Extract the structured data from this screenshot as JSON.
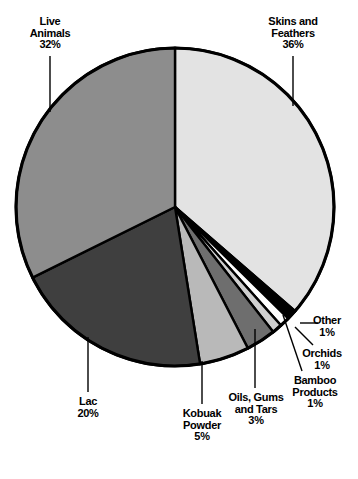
{
  "chart_data": {
    "type": "pie",
    "title": "",
    "subtitle": "",
    "xlabel": "",
    "ylabel": "",
    "legend_position": "none",
    "grid": false,
    "labels_show_percent": true,
    "start_angle_deg": 0,
    "direction": "clockwise",
    "categories": [
      "Skins and Feathers",
      "Other",
      "Orchids",
      "Bamboo Products",
      "Oils, Gums and Tars",
      "Kobuak Powder",
      "Lac",
      "Live Animals"
    ],
    "values": [
      36,
      1,
      1,
      1,
      3,
      5,
      20,
      32
    ],
    "value_labels": [
      "36%",
      "1%",
      "1%",
      "1%",
      "3%",
      "5%",
      "20%",
      "32%"
    ],
    "colors": [
      "#e3e3e3",
      "#000000",
      "#ffffff",
      "#cfcfcf",
      "#6e6e6e",
      "#b9b9b9",
      "#3f3f3f",
      "#8d8d8d"
    ],
    "slice_stroke": "#000000",
    "slices": [
      {
        "name": "Skins and Feathers",
        "value": 36,
        "value_label": "36%",
        "label_line1": "Skins and",
        "label_line2": "Feathers",
        "color": "#e3e3e3"
      },
      {
        "name": "Other",
        "value": 1,
        "value_label": "1%",
        "label_line1": "Other",
        "label_line2": "",
        "color": "#000000"
      },
      {
        "name": "Orchids",
        "value": 1,
        "value_label": "1%",
        "label_line1": "Orchids",
        "label_line2": "",
        "color": "#ffffff"
      },
      {
        "name": "Bamboo Products",
        "value": 1,
        "value_label": "1%",
        "label_line1": "Bamboo",
        "label_line2": "Products",
        "color": "#cfcfcf"
      },
      {
        "name": "Oils, Gums and Tars",
        "value": 3,
        "value_label": "3%",
        "label_line1": "Oils, Gums",
        "label_line2": "and Tars",
        "color": "#6e6e6e"
      },
      {
        "name": "Kobuak Powder",
        "value": 5,
        "value_label": "5%",
        "label_line1": "Kobuak",
        "label_line2": "Powder",
        "color": "#b9b9b9"
      },
      {
        "name": "Lac",
        "value": 20,
        "value_label": "20%",
        "label_line1": "Lac",
        "label_line2": "",
        "color": "#3f3f3f"
      },
      {
        "name": "Live Animals",
        "value": 32,
        "value_label": "32%",
        "label_line1": "Live",
        "label_line2": "Animals",
        "color": "#8d8d8d"
      }
    ]
  }
}
